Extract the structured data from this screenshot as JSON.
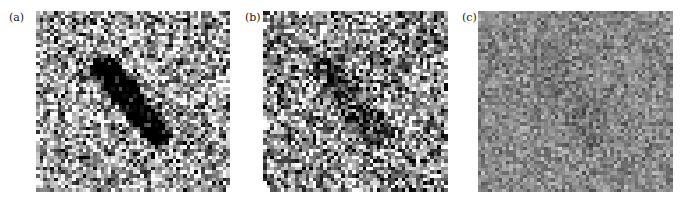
{
  "figure": {
    "background": "#ffffff",
    "panels": [
      {
        "id": "a",
        "label": "(a)",
        "label_pos": [
          9,
          12
        ],
        "rect": [
          36,
          11,
          194,
          181
        ],
        "cells": [
          54,
          50
        ],
        "seed": 11,
        "noise_mean": 0.62,
        "noise_spread": 0.95,
        "contrast": 1.0,
        "bar": {
          "x1": 0.36,
          "y1": 0.32,
          "x2": 0.62,
          "y2": 0.67,
          "half_width": 0.055,
          "depth": 1.0
        }
      },
      {
        "id": "b",
        "label": "(b)",
        "label_pos": [
          245,
          12
        ],
        "rect": [
          263,
          11,
          185,
          181
        ],
        "cells": [
          52,
          50
        ],
        "seed": 23,
        "noise_mean": 0.55,
        "noise_spread": 0.95,
        "contrast": 1.0,
        "bar": {
          "x1": 0.36,
          "y1": 0.32,
          "x2": 0.62,
          "y2": 0.67,
          "half_width": 0.06,
          "depth": 0.42
        }
      },
      {
        "id": "c",
        "label": "(c)",
        "label_pos": [
          462,
          12
        ],
        "rect": [
          478,
          11,
          195,
          181
        ],
        "cells": [
          56,
          52
        ],
        "seed": 37,
        "noise_mean": 0.55,
        "noise_spread": 0.55,
        "contrast": 0.55,
        "bar": {
          "x1": 0.36,
          "y1": 0.3,
          "x2": 0.6,
          "y2": 0.65,
          "half_width": 0.07,
          "depth": 0.14
        }
      }
    ]
  }
}
